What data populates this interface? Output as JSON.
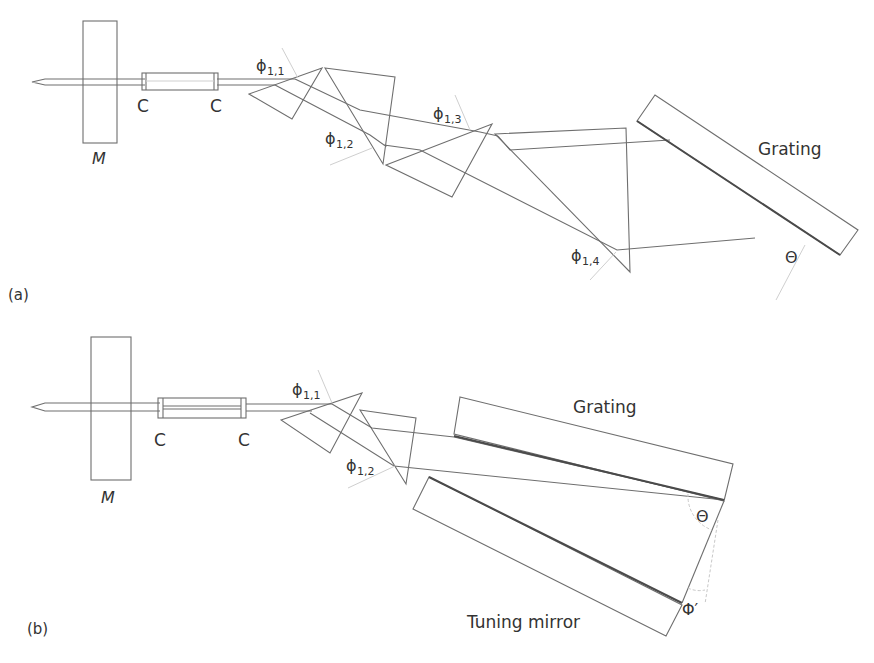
{
  "figure": {
    "panel_a": {
      "label": "(a)",
      "mirror_label": "M",
      "coupler_labels": [
        "C",
        "C"
      ],
      "phi_labels": [
        {
          "symbol": "ϕ",
          "sub": "1,1"
        },
        {
          "symbol": "ϕ",
          "sub": "1,2"
        },
        {
          "symbol": "ϕ",
          "sub": "1,3"
        },
        {
          "symbol": "ϕ",
          "sub": "1,4"
        }
      ],
      "grating_label": "Grating",
      "theta_label": "Θ"
    },
    "panel_b": {
      "label": "(b)",
      "mirror_label": "M",
      "coupler_labels": [
        "C",
        "C"
      ],
      "phi_labels": [
        {
          "symbol": "ϕ",
          "sub": "1,1"
        },
        {
          "symbol": "ϕ",
          "sub": "1,2"
        }
      ],
      "grating_label": "Grating",
      "theta_label": "Θ",
      "phi_prime_label": "Φ′",
      "tuning_mirror_label": "Tuning mirror"
    }
  }
}
